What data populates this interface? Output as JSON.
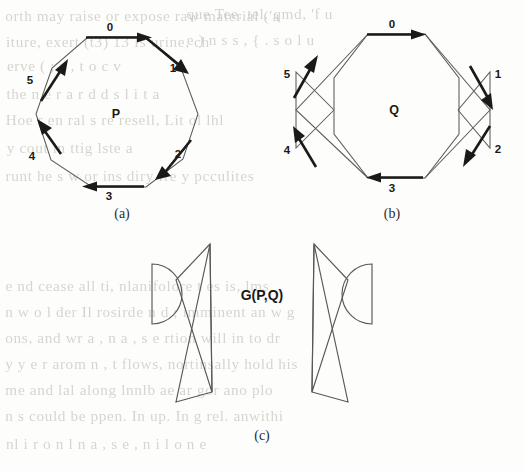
{
  "figure": {
    "panels": [
      {
        "id": "a",
        "caption": "(a)",
        "shape_label": "P",
        "shape_kind": "convex-decagon",
        "edge_labels": [
          "0",
          "1",
          "2",
          "3",
          "4",
          "5"
        ]
      },
      {
        "id": "b",
        "caption": "(b)",
        "shape_label": "Q",
        "shape_kind": "self-intersecting-polygon",
        "edge_labels": [
          "0",
          "1",
          "2",
          "3",
          "4",
          "5"
        ]
      },
      {
        "id": "c",
        "caption": "(c)",
        "shape_label": "G(P,Q)",
        "shape_kind": "minkowski-sum-bowties-and-semicircles",
        "edge_labels": []
      }
    ]
  },
  "colors": {
    "page_background": "#fdfdfb",
    "thin_stroke": "#5e5b57",
    "bold_stroke": "#1c1a19",
    "bleed_text": "#b9b4ad",
    "label_text": "#1a1918"
  },
  "background_text": {
    "note": "faint bleed-through text from the reverse side of the scanned page",
    "lines": [
      {
        "text": "orth may raise or expose raw material ('a",
        "x": 8,
        "y": 8
      },
      {
        "text": "que Tee. tel. qmd, 'f u",
        "x": 188,
        "y": 6
      },
      {
        "text": "iture, exert (t3) 13   Is urine, ch",
        "x": 8,
        "y": 34
      },
      {
        "text": "e    )   n   s   s   ,   {   .  s  o l u",
        "x": 188,
        "y": 32
      },
      {
        "text": "erve       (   ;   s     ,   t  o c v",
        "x": 8,
        "y": 58
      },
      {
        "text": "the     n  e  r  a  r  d  d  s   l  i  t  a",
        "x": 8,
        "y": 86
      },
      {
        "text": "Hoe r en ral s re resell,  Lit ol lhl",
        "x": 8,
        "y": 112
      },
      {
        "text": "y  cout in   ttig  lste  a",
        "x": 8,
        "y": 140
      },
      {
        "text": "runt    he s w or ins diry    fre  y  pcculites",
        "x": 8,
        "y": 168
      },
      {
        "text": "e    nd    cease    all     ti, nlanifolore   t es is, lms",
        "x": 8,
        "y": 278
      },
      {
        "text": "n    w o  l der  Il   rosirde  n  d   ; imminent  an w g",
        "x": 8,
        "y": 304
      },
      {
        "text": "ons,  and  wr a ,  n a , s e rtion    will  in  to  dr",
        "x": 8,
        "y": 330
      },
      {
        "text": "y   y  e r  arom   n   ,  t  flows,   nortinsally   hold    his",
        "x": 8,
        "y": 356
      },
      {
        "text": "me  and  lal  along  lnnlb  ae  ar  gor  ano plo",
        "x": 8,
        "y": 382
      },
      {
        "text": "n   s  could  be  ppen.  In  up.   In g  rel. anwithi",
        "x": 8,
        "y": 408
      },
      {
        "text": "nl      i  r  o n l  n     a , s e , n i l   o   n   e",
        "x": 8,
        "y": 436
      }
    ]
  }
}
